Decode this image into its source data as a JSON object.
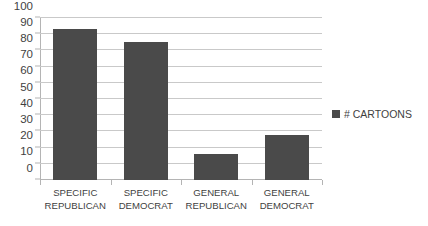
{
  "chart_data": {
    "type": "bar",
    "title": "",
    "xlabel": "",
    "ylabel": "",
    "categories": [
      "SPECIFIC REPUBLICAN",
      "SPECIFIC DEMOCRAT",
      "GENERAL REPUBLICAN",
      "GENERAL DEMOCRAT"
    ],
    "category_lines": [
      [
        "SPECIFIC",
        "REPUBLICAN"
      ],
      [
        "SPECIFIC",
        "DEMOCRAT"
      ],
      [
        "GENERAL",
        "REPUBLICAN"
      ],
      [
        "GENERAL",
        "DEMOCRAT"
      ]
    ],
    "series": [
      {
        "name": "# CARTOONS",
        "values": [
          93,
          85,
          16,
          28
        ]
      }
    ],
    "values": [
      93,
      85,
      16,
      28
    ],
    "ylim": [
      0,
      100
    ],
    "ytick_step": 10,
    "yticks": [
      0,
      10,
      20,
      30,
      40,
      50,
      60,
      70,
      80,
      90,
      100
    ],
    "ytick_labels": [
      "0",
      "10",
      "20",
      "30",
      "40",
      "50",
      "60",
      "70",
      "80",
      "90",
      "100"
    ],
    "grid": true,
    "grid_axis": "y",
    "legend": {
      "position": "right",
      "entries": [
        "# CARTOONS"
      ]
    }
  },
  "legend": {
    "label": "# CARTOONS",
    "swatch_name": "legend-color-swatch"
  },
  "colors": {
    "bar_fill": "#4a4a4a",
    "gridline": "#c9c9c9",
    "axis": "#b4b4b4",
    "text": "#3f3f3f",
    "background": "#ffffff"
  }
}
